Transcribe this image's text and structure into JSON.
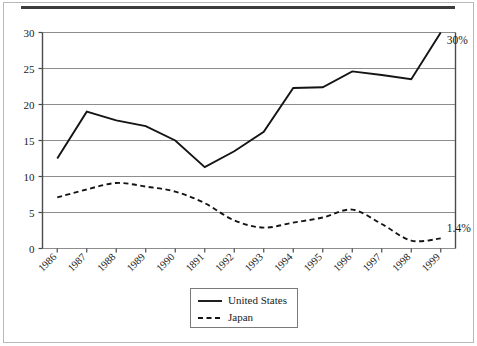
{
  "figure": {
    "has_top_rule": true,
    "has_outer_border": true
  },
  "chart_data": {
    "type": "line",
    "title": "",
    "subtitle": "",
    "xlabel": "",
    "ylabel": "",
    "x": [
      "1986",
      "1987",
      "1988",
      "1989",
      "1990",
      "1891",
      "1992",
      "1993",
      "1994",
      "1995",
      "1996",
      "1997",
      "1998",
      "1999"
    ],
    "categories": [
      "1986",
      "1987",
      "1988",
      "1989",
      "1990",
      "1891",
      "1992",
      "1993",
      "1994",
      "1995",
      "1996",
      "1997",
      "1998",
      "1999"
    ],
    "ylim": [
      0,
      30
    ],
    "yticks": [
      0,
      5,
      10,
      15,
      20,
      25,
      30
    ],
    "ytick_labels": [
      "0",
      "5",
      "10",
      "15",
      "20",
      "25",
      "30"
    ],
    "grid": true,
    "grid_axis": "y",
    "legend_position": "bottom-center",
    "series": [
      {
        "name": "United States",
        "style": "solid",
        "color": "#141414",
        "smoothing": "linear",
        "values": [
          12.5,
          19.0,
          17.8,
          17.0,
          15.0,
          11.3,
          13.5,
          16.2,
          22.3,
          22.4,
          24.6,
          24.1,
          23.5,
          30.0
        ]
      },
      {
        "name": "Japan",
        "style": "dashed",
        "color": "#141414",
        "smoothing": "spline",
        "values": [
          7.1,
          8.2,
          9.1,
          8.6,
          7.9,
          6.3,
          3.9,
          2.9,
          3.6,
          4.3,
          5.4,
          3.4,
          1.1,
          1.4
        ]
      }
    ],
    "annotations": [
      {
        "text": "30%",
        "series": "United States",
        "x": "1999",
        "y": 30.0
      },
      {
        "text": "1.4%",
        "series": "Japan",
        "x": "1999",
        "y": 1.4
      }
    ]
  },
  "legend": {
    "entries": [
      {
        "label": "United States",
        "style": "solid"
      },
      {
        "label": "Japan",
        "style": "dashed"
      }
    ]
  }
}
